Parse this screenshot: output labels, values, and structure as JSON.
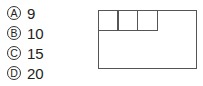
{
  "question": {
    "options": [
      {
        "letter": "A",
        "value": "9"
      },
      {
        "letter": "B",
        "value": "10"
      },
      {
        "letter": "C",
        "value": "15"
      },
      {
        "letter": "D",
        "value": "20"
      }
    ]
  },
  "figure": {
    "small_square_count": 3
  }
}
